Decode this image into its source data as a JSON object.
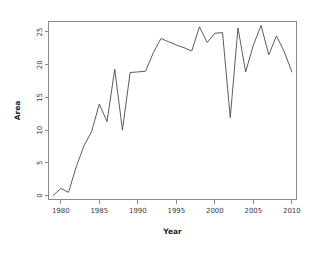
{
  "chart_data": {
    "type": "line",
    "title": "",
    "xlabel": "Year",
    "ylabel": "Area",
    "xlim": [
      1978.4,
      2010.6
    ],
    "ylim": [
      -0.6,
      26.6
    ],
    "xticks": [
      1980,
      1985,
      1990,
      1995,
      2000,
      2005,
      2010
    ],
    "xtick_labels": [
      "1980",
      "1985",
      "1990",
      "1995",
      "2000",
      "2005",
      "2010"
    ],
    "yticks": [
      0,
      5,
      10,
      15,
      20,
      25
    ],
    "ytick_labels": [
      "0",
      "5",
      "10",
      "15",
      "20",
      "25"
    ],
    "grid": false,
    "legend": null,
    "line_color": "#4a4a4a",
    "frame_color": "#8a8a8a",
    "background_color": "#ffffff",
    "x": [
      1979,
      1980,
      1981,
      1982,
      1983,
      1984,
      1985,
      1986,
      1987,
      1988,
      1989,
      1990,
      1991,
      1992,
      1993,
      1994,
      1995,
      1996,
      1997,
      1998,
      1999,
      2000,
      2001,
      2002,
      2003,
      2004,
      2005,
      2006,
      2007,
      2008,
      2009,
      2010
    ],
    "values": [
      0.0,
      1.1,
      0.5,
      4.4,
      7.6,
      9.8,
      14.0,
      11.3,
      19.3,
      10.0,
      18.8,
      18.9,
      19.0,
      21.8,
      24.0,
      23.5,
      23.0,
      22.6,
      22.1,
      25.8,
      23.4,
      24.8,
      24.9,
      11.9,
      25.6,
      18.9,
      23.0,
      26.0,
      21.5,
      24.4,
      22.0,
      18.9
    ],
    "series_name": "Area"
  },
  "axes": {
    "x_title": "Year",
    "y_title": "Area"
  }
}
